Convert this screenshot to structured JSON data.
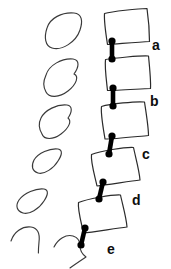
{
  "figure": {
    "background_color": "#ffffff",
    "line_color": "#3a3a3a",
    "connector_color": "#000000",
    "label_color": "#0d0d0d",
    "width": 171,
    "height": 269
  },
  "labels": [
    {
      "id": "a",
      "text": "a",
      "x": 152,
      "y": 50
    },
    {
      "id": "b",
      "text": "b",
      "x": 150,
      "y": 106
    },
    {
      "id": "c",
      "text": "c",
      "x": 142,
      "y": 159
    },
    {
      "id": "d",
      "text": "d",
      "x": 132,
      "y": 205
    },
    {
      "id": "e",
      "text": "e",
      "x": 107,
      "y": 254
    }
  ],
  "vertebral_bodies": [
    {
      "id": "body-1",
      "path": "M 104 12 L 147 8 L 150 41 L 107 44 Z",
      "smooth_path": "M 104.5 13.5 C 112 11.5 138 8.5 147 8.5 C 148.5 19 149.5 33 149.5 41.5 C 138 42 116 44 107.5 44.5 C 106 35 104 21 104.5 13.5 Z"
    },
    {
      "id": "body-2",
      "path": "M 105 58 L 149 56 L 151 88 L 107 90 Z",
      "smooth_path": "M 105.5 59.5 C 114 58 140 55.5 148.5 56 C 149.5 66 151 81 150.5 88.5 C 139 89 116 90.5 107.5 90.5 C 106.5 81 104.5 67 105.5 59.5 Z"
    },
    {
      "id": "body-3",
      "path": "M 101 105 L 145 102 L 149 135 L 104 139 Z",
      "smooth_path": "M 101.5 106.5 C 110 104 136 101 144.5 102 C 146 112 148.5 127 148.5 135.5 C 137 136.5 114 139 105 139 C 103.5 129.5 100.5 114 101.5 106.5 Z"
    },
    {
      "id": "body-4",
      "path": "M 91 153 L 134 147 L 140 180 L 96 186 Z",
      "smooth_path": "M 91.5 154.5 C 100 151 125 147 133.5 147.5 C 135.5 157 139.5 171.5 140 180 C 128.5 181.5 105.5 185 97 186 C 95 176.5 90.5 162 91.5 154.5 Z"
    },
    {
      "id": "body-5",
      "path": "M 78 201 L 121 194 L 127 226 L 83 233 Z",
      "smooth_path": "M 78.5 202.5 C 87 199 112 194.5 120.5 195 C 122.5 204.5 126.5 218.5 127 227 C 115.5 228.5 92 232 83.5 233 C 81.5 223.5 77.5 210 78.5 202.5 Z"
    }
  ],
  "connectors": [
    {
      "id": "connector-a",
      "x1": 112,
      "y1": 41,
      "x2": 112,
      "y2": 59,
      "r_top": 3.6,
      "r_bottom": 3.6
    },
    {
      "id": "connector-b",
      "x1": 113,
      "y1": 88,
      "x2": 113,
      "y2": 106,
      "r_top": 3.6,
      "r_bottom": 3.6
    },
    {
      "id": "connector-c",
      "x1": 112,
      "y1": 136,
      "x2": 109,
      "y2": 154,
      "r_top": 3.6,
      "r_bottom": 3.6
    },
    {
      "id": "connector-d",
      "x1": 103,
      "y1": 182,
      "x2": 99,
      "y2": 199,
      "r_top": 3.6,
      "r_bottom": 3.6
    },
    {
      "id": "connector-e",
      "x1": 85,
      "y1": 228,
      "x2": 81,
      "y2": 245,
      "r_top": 3.6,
      "r_bottom": 3.6
    }
  ],
  "disc_outlines": [
    {
      "id": "disc-1",
      "path": "M 47 28 C 50 18 62 12 74 13 C 82 13.6 83 21 80 30 C 76 42 62 51 52 48 C 45 46 44 37 47 28 Z"
    },
    {
      "id": "disc-2",
      "path": "M 46 75 C 49 65 62 58 73 59 C 80 60 79 67 74 74 C 79 76 77 84 68 91 C 59 98 49 98 46 92 C 43 86 43 82 46 75 Z"
    },
    {
      "id": "disc-3",
      "path": "M 41 118 C 45 110 57 104 67 105 C 73 106 72 112 68 118 C 72 121 69 128 61 134 C 53 140 44 140 42 134 C 39 129 38 124 41 118 Z"
    },
    {
      "id": "disc-4",
      "path": "M 34 160 C 38 153 50 148 58 149 C 63 150 62 155 58 161 C 54 168 44 175 38 173 C 32 171 31 166 34 160 Z"
    },
    {
      "id": "disc-5",
      "path": "M 19 200 C 24 193 36 188 44 189 C 49 190 48 195 44 201 C 39 209 29 215 23 213 C 17 211 15 206 19 200 Z"
    }
  ],
  "process_outlines": [
    {
      "id": "process-lower-left",
      "path": "M 11 241 C 14 232 22 226 31 227 C 38 228 40 234 39 242 C 38.6 246 38.4 250 38.4 253"
    },
    {
      "id": "process-lower-right",
      "path": "M 54 247 C 58 239 66 234 73 236 C 78 237.5 80 242 80 246 C 80 250 82 254 86 257 C 80 261 74 265 70 268"
    }
  ]
}
